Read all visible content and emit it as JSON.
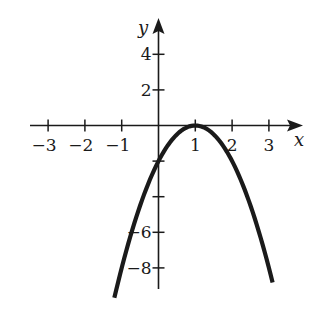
{
  "chart_data": {
    "type": "line",
    "title": "",
    "function": "y = -2(x - 1)^2",
    "xlabel": "x",
    "ylabel": "y",
    "xlim": [
      -3.5,
      3.9
    ],
    "ylim": [
      -9.5,
      5.8
    ],
    "x_ticks": [
      {
        "value": -3,
        "label": "−3"
      },
      {
        "value": -2,
        "label": "−2"
      },
      {
        "value": -1,
        "label": "−1"
      },
      {
        "value": 1,
        "label": "1"
      },
      {
        "value": 2,
        "label": "2"
      },
      {
        "value": 3,
        "label": "3"
      }
    ],
    "y_ticks": [
      {
        "value": 4,
        "label": "4"
      },
      {
        "value": 2,
        "label": "2"
      },
      {
        "value": -2,
        "label": ""
      },
      {
        "value": -4,
        "label": ""
      },
      {
        "value": -6,
        "label": "−6"
      },
      {
        "value": -8,
        "label": "−8"
      }
    ],
    "series": [
      {
        "name": "parabola",
        "x_range": [
          -1.2,
          3.1
        ],
        "points": [
          [
            -1.2,
            -9.68
          ],
          [
            -1,
            -8
          ],
          [
            -0.5,
            -4.5
          ],
          [
            0,
            -2
          ],
          [
            0.5,
            -0.5
          ],
          [
            1,
            0
          ],
          [
            1.5,
            -0.5
          ],
          [
            2,
            -2
          ],
          [
            2.5,
            -4.5
          ],
          [
            3,
            -8
          ],
          [
            3.1,
            -8.82
          ]
        ]
      }
    ],
    "grid": false,
    "legend": "none",
    "colors": {
      "ink": "#1a1a1a",
      "background": "#ffffff"
    }
  }
}
